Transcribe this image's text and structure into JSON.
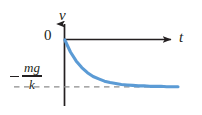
{
  "figure": {
    "background_color": "#ffffff",
    "axis_color": "#231f20",
    "curve_color": "#5b9bd5",
    "asymptote_color": "#8c8c8c"
  },
  "labels": {
    "y_axis": "v",
    "x_axis": "t",
    "origin": "0",
    "asymptote_numerator": "mg",
    "asymptote_denominator": "k",
    "asymptote_sign": "minus"
  },
  "chart_data": {
    "type": "line",
    "title": "",
    "xlabel": "t",
    "ylabel": "v",
    "grid": false,
    "legend": null,
    "annotations": [
      {
        "text": "-mg/k",
        "kind": "asymptote-label",
        "position": "left-of-y-axis"
      }
    ],
    "xlim": [
      0,
      1
    ],
    "ylim": [
      -1.15,
      0.1
    ],
    "asymptote": {
      "value": -1.0,
      "label": "-mg/k",
      "style": "dashed",
      "color": "#8c8c8c"
    },
    "series": [
      {
        "name": "v(t)",
        "formula": "v = -(mg/k)(1 - exp(-k t / m))",
        "color": "#5b9bd5",
        "x": [
          0.0,
          0.05,
          0.1,
          0.15,
          0.2,
          0.25,
          0.3,
          0.35,
          0.4,
          0.45,
          0.5,
          0.55,
          0.6,
          0.65,
          0.7,
          0.75,
          0.8,
          0.85,
          0.9,
          0.95,
          1.0
        ],
        "y": [
          0.0,
          -0.26,
          -0.45,
          -0.59,
          -0.7,
          -0.78,
          -0.83,
          -0.88,
          -0.91,
          -0.93,
          -0.95,
          -0.96,
          -0.97,
          -0.98,
          -0.98,
          -0.99,
          -0.99,
          -0.99,
          -1.0,
          -1.0,
          -1.0
        ]
      }
    ]
  }
}
